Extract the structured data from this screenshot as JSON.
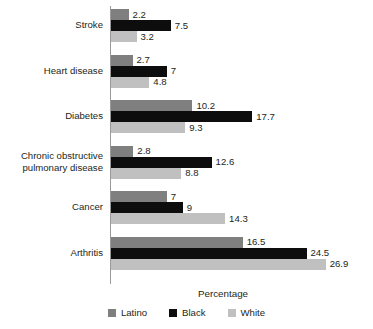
{
  "chart_data": {
    "type": "bar",
    "orientation": "horizontal",
    "title": "",
    "xlabel": "Percentage",
    "ylabel": "",
    "xlim": [
      0,
      26.9
    ],
    "grid": false,
    "legend_position": "bottom",
    "categories": [
      "Stroke",
      "Heart disease",
      "Diabetes",
      "Chronic obstructive\npulmonary disease",
      "Cancer",
      "Arthritis"
    ],
    "series": [
      {
        "name": "Latino",
        "color": "#7f7f7f",
        "values": [
          2.2,
          2.7,
          10.2,
          2.8,
          7,
          16.5
        ],
        "labels": [
          "2.2",
          "2.7",
          "10.2",
          "2.8",
          "7",
          "16.5"
        ]
      },
      {
        "name": "Black",
        "color": "#0d0d0d",
        "values": [
          7.5,
          7,
          17.7,
          12.6,
          9,
          24.5
        ],
        "labels": [
          "7.5",
          "7",
          "17.7",
          "12.6",
          "9",
          "24.5"
        ]
      },
      {
        "name": "White",
        "color": "#c0c0c0",
        "values": [
          3.2,
          4.8,
          9.3,
          8.8,
          14.3,
          26.9
        ],
        "labels": [
          "3.2",
          "4.8",
          "9.3",
          "8.8",
          "14.3",
          "26.9"
        ]
      }
    ]
  },
  "axis": {
    "x_title": "Percentage"
  },
  "legend": {
    "items": [
      {
        "label": "Latino",
        "color": "#7f7f7f"
      },
      {
        "label": "Black",
        "color": "#0d0d0d"
      },
      {
        "label": "White",
        "color": "#c0c0c0"
      }
    ]
  }
}
